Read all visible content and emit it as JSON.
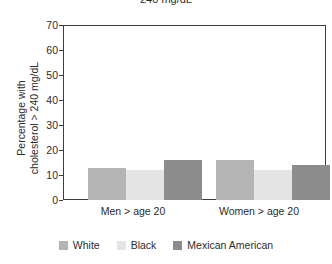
{
  "chart_data": {
    "type": "bar",
    "title": "240 mg/dL",
    "title_note": "Title is clipped by the top edge of the screenshot; only the lower half of the text is visible.",
    "xlabel": "",
    "ylabel": "Percentage with cholesterol > 240 mg/dL",
    "ylabel_lines": [
      "Percentage with",
      "cholesterol > 240 mg/dL"
    ],
    "categories": [
      "Men > age 20",
      "Women > age 20"
    ],
    "series": [
      {
        "name": "White",
        "values": [
          13,
          16
        ],
        "color": "#b4b4b4"
      },
      {
        "name": "Black",
        "values": [
          12,
          12
        ],
        "color": "#e4e4e4"
      },
      {
        "name": "Mexican American",
        "values": [
          16,
          14
        ],
        "color": "#8c8c8c"
      }
    ],
    "ylim": [
      0,
      70
    ],
    "ytick_values": [
      0,
      10,
      20,
      30,
      40,
      50,
      60,
      70
    ],
    "ytick_labels": [
      "0",
      "10",
      "20",
      "30",
      "40",
      "50",
      "60",
      "70"
    ],
    "grid": false,
    "legend_position": "bottom",
    "frame": true,
    "bar_edge_color": "none"
  },
  "axes": {
    "y_labels": [
      "70",
      "60",
      "50",
      "40",
      "30",
      "20",
      "10",
      "0"
    ],
    "x_labels": [
      "Men > age 20",
      "Women > age 20"
    ]
  },
  "legend": {
    "items": [
      {
        "label": "White",
        "color": "#b4b4b4"
      },
      {
        "label": "Black",
        "color": "#e4e4e4"
      },
      {
        "label": "Mexican American",
        "color": "#8c8c8c"
      }
    ]
  },
  "colors": {
    "axis": "#3d3d3d",
    "text": "#2b2b2b",
    "background": "#ffffff",
    "white_series": "#b4b4b4",
    "black_series": "#e4e4e4",
    "mexican_american_series": "#8c8c8c"
  }
}
